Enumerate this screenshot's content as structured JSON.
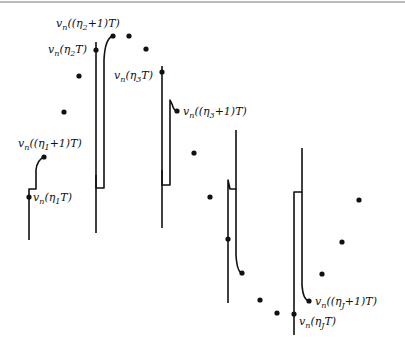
{
  "figure": {
    "labels": [
      {
        "id": "eta1T",
        "v": "v",
        "n": "n",
        "arg_pre": "(η",
        "idx": "1",
        "arg_post": "T)",
        "x": 33,
        "y": 201
      },
      {
        "id": "eta1p1T",
        "v": "v",
        "n": "n",
        "arg_pre": "((η",
        "idx": "1",
        "arg_post": "+1)T)",
        "x": 18,
        "y": 147
      },
      {
        "id": "eta2T",
        "v": "v",
        "n": "n",
        "arg_pre": "(η",
        "idx": "2",
        "arg_post": "T)",
        "x": 48,
        "y": 53
      },
      {
        "id": "eta2p1T",
        "v": "v",
        "n": "n",
        "arg_pre": "((η",
        "idx": "2",
        "arg_post": "+1)T)",
        "x": 56,
        "y": 27
      },
      {
        "id": "eta3T",
        "v": "v",
        "n": "n",
        "arg_pre": "(η",
        "idx": "3",
        "arg_post": "T)",
        "x": 114,
        "y": 79
      },
      {
        "id": "eta3p1T",
        "v": "v",
        "n": "n",
        "arg_pre": "((η",
        "idx": "3",
        "arg_post": "+1)T)",
        "x": 183,
        "y": 115
      },
      {
        "id": "etaJp1T",
        "v": "v",
        "n": "n",
        "arg_pre": "((η",
        "idx": "J",
        "arg_post": "+1)T)",
        "x": 315,
        "y": 305
      },
      {
        "id": "etaJT",
        "v": "v",
        "n": "n",
        "arg_pre": "(η",
        "idx": "J",
        "arg_post": "T)",
        "x": 299,
        "y": 325
      }
    ],
    "sample_dots": [
      [
        29,
        197
      ],
      [
        44,
        157
      ],
      [
        64,
        112
      ],
      [
        79,
        76
      ],
      [
        96,
        50
      ],
      [
        113,
        36
      ],
      [
        129,
        36
      ],
      [
        146,
        49
      ],
      [
        162,
        72
      ],
      [
        177,
        111
      ],
      [
        194,
        153
      ],
      [
        210,
        197
      ],
      [
        228,
        239
      ],
      [
        242,
        273
      ],
      [
        260,
        300
      ],
      [
        277,
        313
      ],
      [
        294,
        314
      ],
      [
        309,
        301
      ],
      [
        322,
        274
      ],
      [
        342,
        242
      ],
      [
        359,
        200
      ]
    ],
    "colors": {
      "ink": "#111111",
      "rule": "#777777",
      "background": "#ffffff"
    }
  }
}
